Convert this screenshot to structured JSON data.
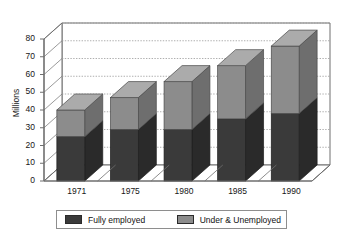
{
  "title": "",
  "legend": {
    "position": "bottom",
    "entries": [
      {
        "label": "Fully employed",
        "color": "#3a3a3a"
      },
      {
        "label": "Under & Unemployed",
        "color": "#8c8c8c"
      }
    ]
  },
  "axis": {
    "ylabel": "Millions",
    "yticks": [
      "80",
      "70",
      "60",
      "50",
      "40",
      "30",
      "20",
      "10",
      "0"
    ],
    "xticks": [
      "1971",
      "1975",
      "1980",
      "1985",
      "1990"
    ]
  },
  "colors": {
    "fully_employed": "#3a3a3a",
    "fully_employed_top": "#5c5c5c",
    "fully_employed_side": "#2a2a2a",
    "under_unemployed": "#8c8c8c",
    "under_unemployed_top": "#ababab",
    "under_unemployed_side": "#6e6e6e",
    "axis_line": "#6f6f6f",
    "grid": "#9a9a9a",
    "floor": "#ffffff",
    "background": "#ffffff"
  },
  "chart_data": {
    "type": "bar",
    "subtype": "stacked-3d-column",
    "title": "",
    "xlabel": "",
    "ylabel": "Millions",
    "ylim": [
      0,
      80
    ],
    "ytick_step": 10,
    "grid": true,
    "legend_position": "bottom",
    "categories": [
      "1971",
      "1975",
      "1980",
      "1985",
      "1990"
    ],
    "series": [
      {
        "name": "Fully employed",
        "color": "#3a3a3a",
        "values": [
          25,
          29,
          29,
          35,
          38
        ]
      },
      {
        "name": "Under & Unemployed",
        "color": "#8c8c8c",
        "values": [
          15,
          18,
          27,
          30,
          38
        ]
      }
    ],
    "totals": [
      40,
      47,
      56,
      65,
      76
    ]
  }
}
